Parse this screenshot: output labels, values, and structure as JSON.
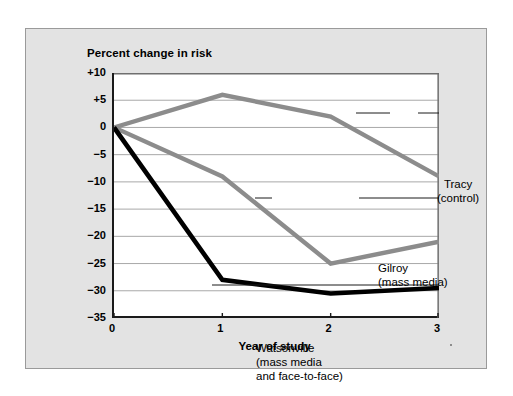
{
  "chart_data": {
    "type": "line",
    "title": "Percent change in risk",
    "xlabel": "Year of study",
    "ylabel": "Percent change in risk",
    "x": [
      0,
      1,
      2,
      3
    ],
    "xticklabels": [
      "0",
      "1",
      "2",
      "3"
    ],
    "xlim": [
      0,
      3
    ],
    "ylim": [
      -35,
      10
    ],
    "yticks": [
      10,
      5,
      0,
      -5,
      -10,
      -15,
      -20,
      -25,
      -30,
      -35
    ],
    "yticklabels": [
      "+10",
      "+5",
      "0",
      "−5",
      "−10",
      "−15",
      "−20",
      "−25",
      "−30",
      "−35"
    ],
    "grid": true,
    "grid_axis": "y",
    "legend": "inline-annotations",
    "series": [
      {
        "name": "Tracy (control)",
        "label_lines": [
          "Tracy",
          "(control)"
        ],
        "color": "#8c8c8c",
        "values": [
          0,
          6,
          2,
          -9
        ]
      },
      {
        "name": "Gilroy (mass media)",
        "label_lines": [
          "Gilroy",
          "(mass media)"
        ],
        "color": "#8c8c8c",
        "values": [
          0,
          -9,
          -25,
          -21
        ]
      },
      {
        "name": "Watsonville (mass media and face-to-face)",
        "label_lines": [
          "Watsonville",
          "(mass media",
          "and face-to-face)"
        ],
        "color": "#000000",
        "values": [
          0,
          -28,
          -30.5,
          -29.5
        ]
      }
    ]
  },
  "figure": {
    "title": "Percent change in risk",
    "x_axis_title": "Year of study",
    "y_ticks": [
      "+10",
      "+5",
      "0",
      "−5",
      "−10",
      "−15",
      "−20",
      "−25",
      "−30",
      "−35"
    ],
    "x_ticks": [
      "0",
      "1",
      "2",
      "3"
    ],
    "annotations": {
      "tracy": {
        "line1": "Tracy",
        "line2": "(control)"
      },
      "gilroy": {
        "line1": "Gilroy",
        "line2": "(mass media)"
      },
      "watsonville": {
        "line1": "Watsonville",
        "line2": "(mass media",
        "line3": "and face-to-face)"
      }
    },
    "colors": {
      "panel_background": "#e3e3e3",
      "plot_background": "#ffffff",
      "axis": "#1a1a1a",
      "gridline": "#a8a8a8",
      "gray_series": "#8c8c8c",
      "black_series": "#000000"
    }
  }
}
